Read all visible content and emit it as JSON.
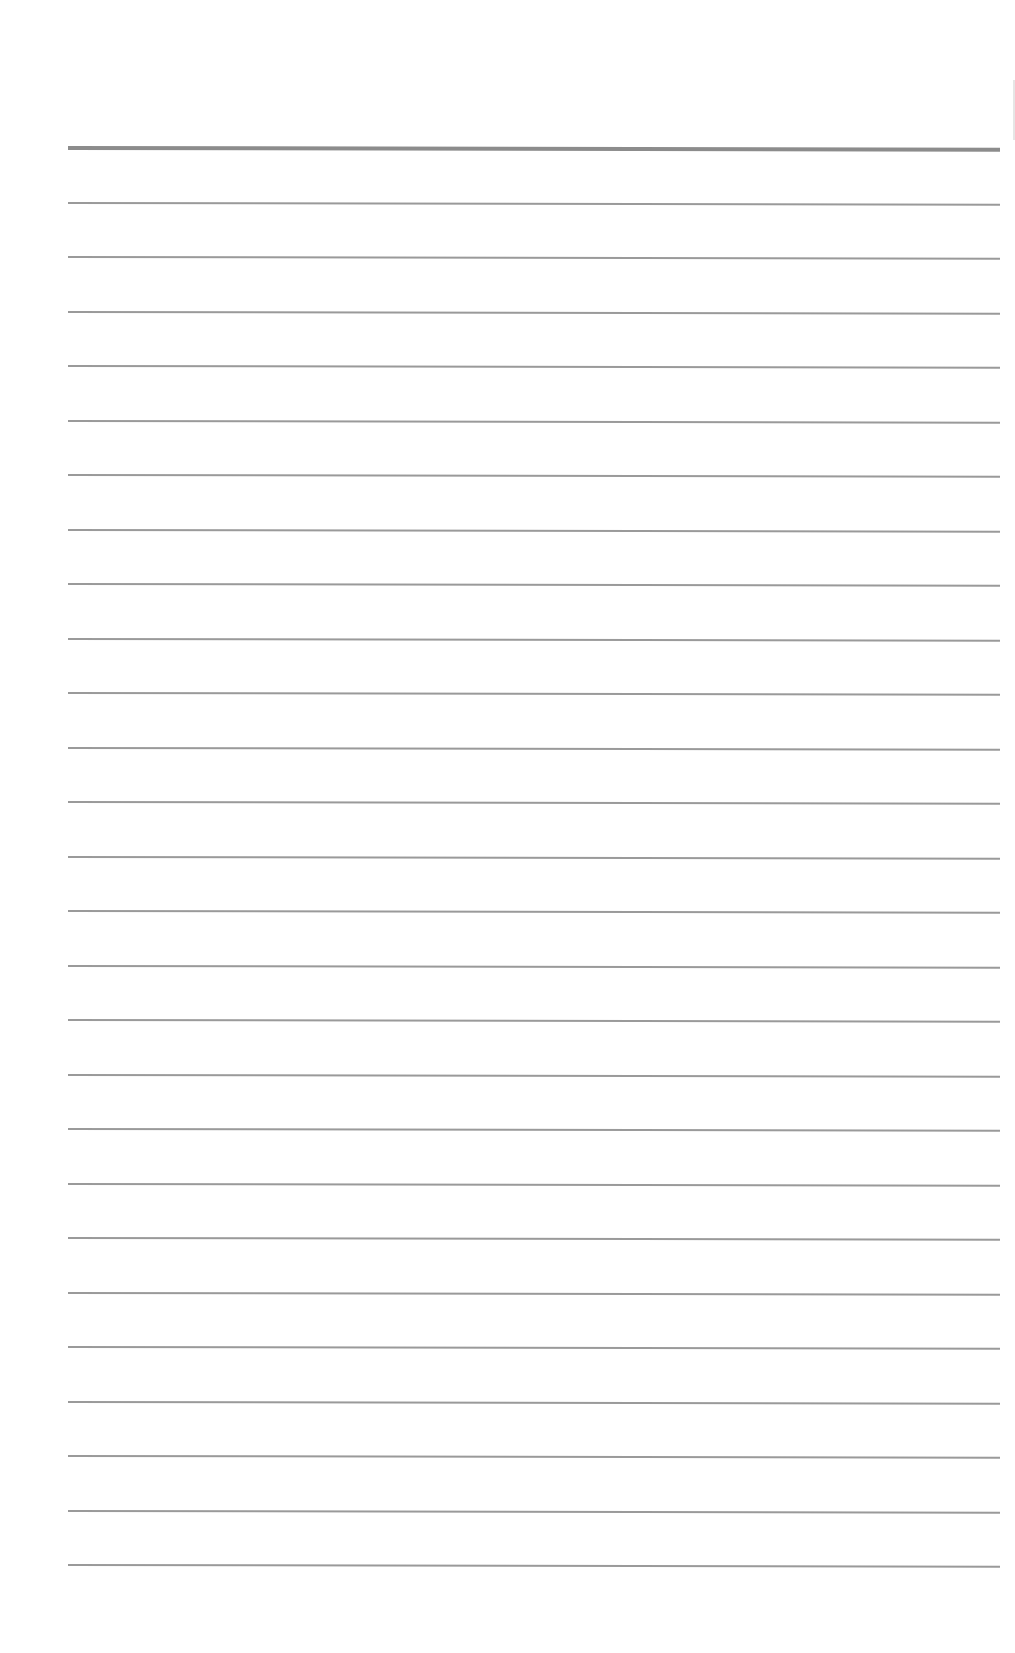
{
  "document": {
    "type": "lined-paper",
    "background_color": "#ffffff",
    "line_color": "#9a9a9a",
    "header_line_color": "#8c8c8c",
    "margin_left_px": 68,
    "line_width_px": 932,
    "header_line": {
      "y": 146,
      "thickness": 4
    },
    "ruled_lines": [
      {
        "y": 202
      },
      {
        "y": 256
      },
      {
        "y": 311
      },
      {
        "y": 365
      },
      {
        "y": 420
      },
      {
        "y": 474
      },
      {
        "y": 529
      },
      {
        "y": 583
      },
      {
        "y": 638
      },
      {
        "y": 692
      },
      {
        "y": 747
      },
      {
        "y": 801
      },
      {
        "y": 856
      },
      {
        "y": 910
      },
      {
        "y": 965
      },
      {
        "y": 1019
      },
      {
        "y": 1074
      },
      {
        "y": 1128
      },
      {
        "y": 1183
      },
      {
        "y": 1237
      },
      {
        "y": 1292
      },
      {
        "y": 1346
      },
      {
        "y": 1401
      },
      {
        "y": 1455
      },
      {
        "y": 1510
      },
      {
        "y": 1564
      }
    ],
    "text": ""
  }
}
